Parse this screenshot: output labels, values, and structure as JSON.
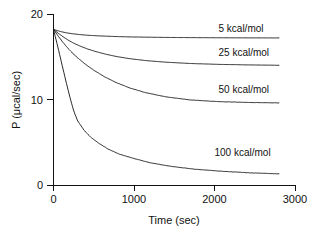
{
  "chart_data": {
    "type": "line",
    "title": "",
    "xlabel": "Time (sec)",
    "ylabel": "P (μcal/sec)",
    "xlim": [
      0,
      3000
    ],
    "ylim": [
      0,
      20
    ],
    "xticks": [
      "0",
      "1000",
      "2000",
      "3000"
    ],
    "xtick_values": [
      0,
      1000,
      2000,
      3000
    ],
    "yticks": [
      "0",
      "10",
      "20"
    ],
    "ytick_values": [
      0,
      10,
      20
    ],
    "grid": false,
    "legend_position": "inline-right-of-curves",
    "series": [
      {
        "name": "5 kcal/mol",
        "label": "5 kcal/mol",
        "label_x": 2050,
        "label_y": 17.9,
        "baseline": 18.2,
        "plateau": 17.2,
        "tau": 330,
        "x": [
          0,
          60,
          120,
          180,
          250,
          330,
          420,
          520,
          640,
          780,
          950,
          1150,
          1400,
          1700,
          2050,
          2400,
          2800
        ],
        "y": [
          18.2,
          18.02,
          17.88,
          17.77,
          17.67,
          17.59,
          17.52,
          17.46,
          17.41,
          17.36,
          17.32,
          17.29,
          17.26,
          17.24,
          17.22,
          17.21,
          17.2
        ]
      },
      {
        "name": "25 kcal/mol",
        "label": "25 kcal/mol",
        "label_x": 2050,
        "label_y": 15.1,
        "baseline": 18.2,
        "plateau": 14.0,
        "tau": 520,
        "x": [
          0,
          60,
          120,
          180,
          250,
          330,
          420,
          520,
          640,
          780,
          950,
          1150,
          1400,
          1700,
          2050,
          2400,
          2800
        ],
        "y": [
          18.2,
          17.74,
          17.33,
          16.96,
          16.59,
          16.25,
          15.92,
          15.62,
          15.32,
          15.03,
          14.77,
          14.55,
          14.36,
          14.21,
          14.11,
          14.05,
          14.0
        ]
      },
      {
        "name": "50 kcal/mol",
        "label": "50 kcal/mol",
        "label_x": 2050,
        "label_y": 10.8,
        "baseline": 18.2,
        "plateau": 9.6,
        "tau": 620,
        "x": [
          0,
          60,
          120,
          180,
          250,
          330,
          420,
          520,
          640,
          780,
          950,
          1150,
          1400,
          1700,
          2050,
          2400,
          2800
        ],
        "y": [
          18.2,
          17.4,
          16.66,
          15.99,
          15.29,
          14.63,
          13.95,
          13.31,
          12.63,
          11.98,
          11.34,
          10.79,
          10.3,
          9.95,
          9.75,
          9.66,
          9.6
        ]
      },
      {
        "name": "100 kcal/mol",
        "label": "100 kcal/mol",
        "label_x": 2000,
        "label_y": 3.4,
        "baseline": 18.2,
        "plateau": 1.3,
        "tau": 560,
        "x": [
          0,
          50,
          100,
          150,
          200,
          250,
          300,
          380,
          460,
          560,
          680,
          820,
          1000,
          1200,
          1450,
          1750,
          2100,
          2450,
          2800
        ],
        "y": [
          18.2,
          16.3,
          14.3,
          12.3,
          10.4,
          8.7,
          7.5,
          6.4,
          5.6,
          4.9,
          4.2,
          3.6,
          3.1,
          2.6,
          2.2,
          1.85,
          1.6,
          1.42,
          1.3
        ]
      }
    ]
  },
  "axes": {
    "y_axis_name": "P (μcal/sec)",
    "x_axis_name": "Time (sec)"
  }
}
